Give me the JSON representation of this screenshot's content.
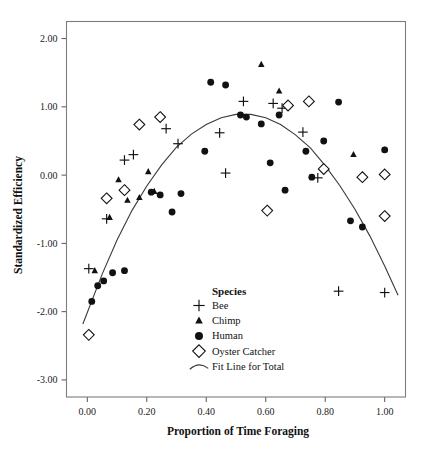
{
  "chart_data": {
    "type": "scatter",
    "title": "",
    "xlabel": "Proportion of Time Foraging",
    "ylabel": "Standardized Efficiency",
    "xlim": [
      -0.07,
      1.07
    ],
    "ylim": [
      -3.25,
      2.25
    ],
    "xticks": [
      0.0,
      0.2,
      0.4,
      0.6,
      0.8,
      1.0
    ],
    "xtick_labels": [
      "0.00",
      "0.20",
      "0.40",
      "0.60",
      "0.80",
      "1.00"
    ],
    "yticks": [
      2.0,
      1.0,
      0.0,
      -1.0,
      -2.0,
      -3.0
    ],
    "ytick_labels": [
      "2.00",
      "1.00",
      "0.00",
      "-1.00",
      "-2.00",
      "-3.00"
    ],
    "grid": false,
    "legend_title": "Species",
    "legend_position": "inside-bottom-center",
    "legend": [
      {
        "name": "Bee",
        "marker": "plus"
      },
      {
        "name": "Chimp",
        "marker": "triangle"
      },
      {
        "name": "Human",
        "marker": "circle"
      },
      {
        "name": "Oyster Catcher",
        "marker": "diamond"
      },
      {
        "name": "Fit Line for Total",
        "marker": "line"
      }
    ],
    "series": [
      {
        "name": "Bee",
        "marker": "plus",
        "points": [
          [
            0.005,
            -1.37
          ],
          [
            0.065,
            -0.64
          ],
          [
            0.125,
            0.22
          ],
          [
            0.155,
            0.3
          ],
          [
            0.265,
            0.68
          ],
          [
            0.305,
            0.46
          ],
          [
            0.445,
            0.62
          ],
          [
            0.465,
            0.03
          ],
          [
            0.525,
            1.08
          ],
          [
            0.625,
            1.05
          ],
          [
            0.655,
            0.98
          ],
          [
            0.725,
            0.63
          ],
          [
            0.775,
            -0.04
          ],
          [
            0.845,
            -1.7
          ],
          [
            1.0,
            -1.72
          ]
        ]
      },
      {
        "name": "Chimp",
        "marker": "triangle",
        "points": [
          [
            0.025,
            -1.4
          ],
          [
            0.075,
            -0.62
          ],
          [
            0.105,
            -0.07
          ],
          [
            0.135,
            -0.37
          ],
          [
            0.175,
            -0.33
          ],
          [
            0.205,
            0.05
          ],
          [
            0.225,
            -0.24
          ],
          [
            0.585,
            1.62
          ],
          [
            0.645,
            1.23
          ],
          [
            0.895,
            0.3
          ],
          [
            1.0,
            0.37
          ]
        ]
      },
      {
        "name": "Human",
        "marker": "circle",
        "points": [
          [
            0.015,
            -1.85
          ],
          [
            0.035,
            -1.62
          ],
          [
            0.055,
            -1.55
          ],
          [
            0.085,
            -1.43
          ],
          [
            0.125,
            -1.4
          ],
          [
            0.215,
            -0.25
          ],
          [
            0.245,
            -0.29
          ],
          [
            0.285,
            -0.54
          ],
          [
            0.315,
            -0.27
          ],
          [
            0.395,
            0.35
          ],
          [
            0.415,
            1.36
          ],
          [
            0.465,
            1.32
          ],
          [
            0.515,
            0.88
          ],
          [
            0.535,
            0.85
          ],
          [
            0.585,
            0.75
          ],
          [
            0.615,
            0.18
          ],
          [
            0.645,
            0.88
          ],
          [
            0.665,
            -0.22
          ],
          [
            0.735,
            0.35
          ],
          [
            0.755,
            -0.03
          ],
          [
            0.795,
            0.5
          ],
          [
            0.845,
            1.07
          ],
          [
            0.885,
            -0.67
          ],
          [
            0.925,
            -0.76
          ],
          [
            1.0,
            0.37
          ]
        ]
      },
      {
        "name": "Oyster Catcher",
        "marker": "diamond",
        "points": [
          [
            0.005,
            -2.34
          ],
          [
            0.065,
            -0.34
          ],
          [
            0.125,
            -0.22
          ],
          [
            0.175,
            0.74
          ],
          [
            0.245,
            0.85
          ],
          [
            0.605,
            -0.52
          ],
          [
            0.675,
            1.02
          ],
          [
            0.745,
            1.08
          ],
          [
            0.795,
            0.09
          ],
          [
            0.925,
            -0.03
          ],
          [
            1.0,
            0.01
          ],
          [
            1.0,
            -0.6
          ]
        ]
      }
    ],
    "fit_line": {
      "name": "Fit Line for Total",
      "kind": "quadratic",
      "peak_x": 0.52,
      "peak_y": 0.9,
      "points": [
        [
          -0.015,
          -2.18
        ],
        [
          0.05,
          -1.45
        ],
        [
          0.1,
          -0.95
        ],
        [
          0.15,
          -0.52
        ],
        [
          0.2,
          -0.16
        ],
        [
          0.25,
          0.15
        ],
        [
          0.3,
          0.41
        ],
        [
          0.35,
          0.6
        ],
        [
          0.4,
          0.74
        ],
        [
          0.45,
          0.84
        ],
        [
          0.5,
          0.89
        ],
        [
          0.55,
          0.89
        ],
        [
          0.6,
          0.84
        ],
        [
          0.65,
          0.74
        ],
        [
          0.7,
          0.59
        ],
        [
          0.75,
          0.4
        ],
        [
          0.8,
          0.14
        ],
        [
          0.85,
          -0.16
        ],
        [
          0.9,
          -0.5
        ],
        [
          0.95,
          -0.89
        ],
        [
          1.0,
          -1.33
        ],
        [
          1.045,
          -1.76
        ]
      ]
    }
  }
}
